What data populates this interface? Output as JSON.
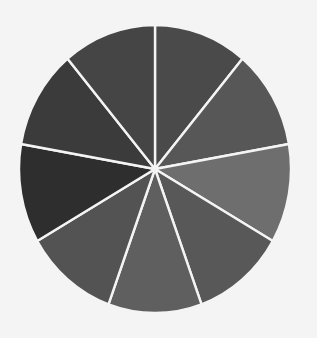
{
  "chart_data": {
    "type": "pie",
    "title": "",
    "legend": "none",
    "start_angle_deg_clockwise_from_top": 0,
    "direction": "clockwise",
    "slices": [
      {
        "label": "",
        "value": 1,
        "color": "#4a4a4a"
      },
      {
        "label": "",
        "value": 1,
        "color": "#575757"
      },
      {
        "label": "",
        "value": 1,
        "color": "#6e6e6e"
      },
      {
        "label": "",
        "value": 1,
        "color": "#585858"
      },
      {
        "label": "",
        "value": 1,
        "color": "#5f5f5f"
      },
      {
        "label": "",
        "value": 1,
        "color": "#535353"
      },
      {
        "label": "",
        "value": 1,
        "color": "#2e2e2e"
      },
      {
        "label": "",
        "value": 1,
        "color": "#3b3b3b"
      },
      {
        "label": "",
        "value": 1,
        "color": "#454545"
      }
    ],
    "slice_separator_color": "#f4f4f4",
    "background_color": "#f4f4f4"
  }
}
